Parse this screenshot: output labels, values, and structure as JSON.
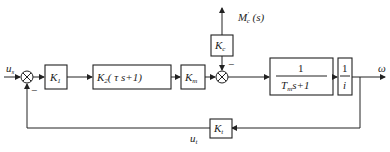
{
  "diagram": {
    "input": {
      "label": "u",
      "sub": "s"
    },
    "output": {
      "label": "ω"
    },
    "disturbance": {
      "label": "M",
      "sup": "′",
      "sub": "c",
      "arg": " (s)"
    },
    "feedback_signal": {
      "label": "u",
      "sub": "t"
    },
    "summer1": {
      "minus_sign": "−"
    },
    "summer2": {
      "minus_sign": "−"
    },
    "blocks": {
      "k1": {
        "label": "K",
        "sub": "1"
      },
      "k2": {
        "label": "K",
        "sub": "2",
        "rest": "( τ s+1)"
      },
      "km": {
        "label": "K",
        "sub": "m"
      },
      "kc": {
        "label": "K",
        "sub": "c"
      },
      "motor": {
        "numerator": "1",
        "denominator": "T",
        "den_sub": "m",
        "den_rest": "s+1"
      },
      "gear": {
        "numerator": "1",
        "denominator": "i"
      },
      "kt": {
        "label": "K",
        "sub": "t"
      }
    }
  }
}
